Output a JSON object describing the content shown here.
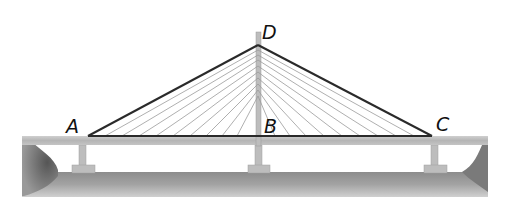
{
  "figure": {
    "points": [
      {
        "id": "A",
        "label": "A",
        "x": 88,
        "y": 136,
        "label_x": 66,
        "label_y": 118
      },
      {
        "id": "B",
        "label": "B",
        "x": 258,
        "y": 136,
        "label_x": 264,
        "label_y": 118
      },
      {
        "id": "C",
        "label": "C",
        "x": 432,
        "y": 136,
        "label_x": 436,
        "label_y": 116
      },
      {
        "id": "D",
        "label": "D",
        "x": 258,
        "y": 45,
        "label_x": 262,
        "label_y": 24
      }
    ],
    "segments": [
      "AD",
      "DC",
      "AC",
      "DB"
    ],
    "cables_left": 9,
    "cables_right": 9,
    "colors": {
      "outline": "#2a2a2a",
      "cable": "#9a9a9a",
      "deck": "#b8b8b8",
      "ground": "#9e9e9e",
      "tower": "#bdbdbd"
    }
  }
}
